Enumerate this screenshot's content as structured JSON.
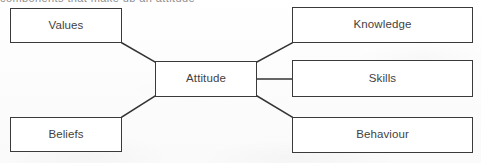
{
  "figure": {
    "clipped_caption_fragment": "components that make up an attitude",
    "background_color": "#fdfdfd",
    "box_fill_color": "#ffffff",
    "box_border_color": "#3a3a3a",
    "text_color": "#3f3f3f",
    "connector_color": "#333333"
  },
  "nodes": [
    {
      "id": "values",
      "label": "Values",
      "x": 10,
      "y": 8,
      "w": 112,
      "h": 35
    },
    {
      "id": "attitude",
      "label": "Attitude",
      "x": 155,
      "y": 61,
      "w": 102,
      "h": 36
    },
    {
      "id": "beliefs",
      "label": "Beliefs",
      "x": 10,
      "y": 117,
      "w": 112,
      "h": 35
    },
    {
      "id": "knowledge",
      "label": "Knowledge",
      "x": 292,
      "y": 7,
      "w": 181,
      "h": 36
    },
    {
      "id": "skills",
      "label": "Skills",
      "x": 292,
      "y": 60,
      "w": 181,
      "h": 37
    },
    {
      "id": "behaviour",
      "label": "Behaviour",
      "x": 292,
      "y": 117,
      "w": 181,
      "h": 36
    }
  ],
  "connectors": [
    {
      "id": "values-attitude",
      "from": "values",
      "to": "attitude",
      "type": "diagonal",
      "x1": 122,
      "y1": 43,
      "x2": 155,
      "y2": 62
    },
    {
      "id": "beliefs-attitude",
      "from": "beliefs",
      "to": "attitude",
      "type": "diagonal",
      "x1": 122,
      "y1": 117,
      "x2": 155,
      "y2": 96
    },
    {
      "id": "attitude-knowledge",
      "from": "attitude",
      "to": "knowledge",
      "type": "diagonal",
      "x1": 257,
      "y1": 62,
      "x2": 292,
      "y2": 43
    },
    {
      "id": "attitude-skills",
      "from": "attitude",
      "to": "skills",
      "type": "horizontal",
      "x1": 257,
      "y1": 79,
      "x2": 292,
      "y2": 79
    },
    {
      "id": "attitude-behaviour",
      "from": "attitude",
      "to": "behaviour",
      "type": "diagonal",
      "x1": 257,
      "y1": 96,
      "x2": 292,
      "y2": 117
    }
  ]
}
